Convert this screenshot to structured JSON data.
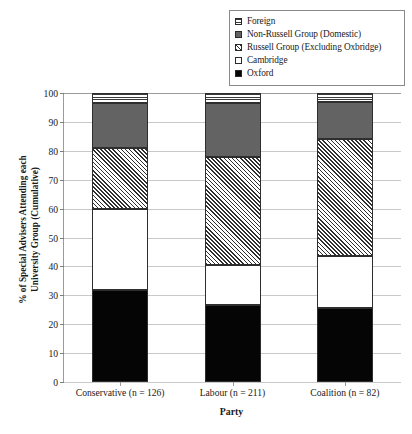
{
  "chart_data": {
    "type": "bar",
    "subtype": "stacked-100-percent",
    "title": "",
    "xlabel": "Party",
    "ylabel": "% of Special Advisers Attending each University Group (Cumulative)",
    "ylabel_lines": [
      "% of Special Advisers Attending each",
      "University Group (Cumulative)"
    ],
    "categories": [
      "Conservative (n = 126)",
      "Labour (n = 211)",
      "Coalition (n = 82)"
    ],
    "ylim": [
      0,
      100
    ],
    "ytick_step": 10,
    "yticks": [
      0,
      10,
      20,
      30,
      40,
      50,
      60,
      70,
      80,
      90,
      100
    ],
    "ytick_labels": [
      "0",
      "10",
      "20",
      "30",
      "40",
      "50",
      "60",
      "70",
      "80",
      "90",
      "100"
    ],
    "grid": true,
    "legend_position": "top-right",
    "series": [
      {
        "name": "Oxford",
        "pattern": "solid-black",
        "color": "#050505",
        "values": [
          31.8,
          26.5,
          25.5
        ],
        "cumulative_top": [
          31.8,
          26.5,
          25.5
        ]
      },
      {
        "name": "Cambridge",
        "pattern": "solid-white",
        "color": "#ffffff",
        "values": [
          28.2,
          14.0,
          18.0
        ],
        "cumulative_top": [
          60.0,
          40.5,
          43.5
        ]
      },
      {
        "name": "Russell Group (Excluding Oxbridge)",
        "pattern": "diagonal-hatch",
        "color": "#2f2f2f",
        "values": [
          21.0,
          37.5,
          40.5
        ],
        "cumulative_top": [
          81.0,
          78.0,
          84.0
        ]
      },
      {
        "name": "Non-Russell Group (Domestic)",
        "pattern": "solid-gray",
        "color": "#636363",
        "values": [
          15.5,
          18.5,
          13.0
        ],
        "cumulative_top": [
          96.5,
          96.5,
          97.0
        ]
      },
      {
        "name": "Foreign",
        "pattern": "horizontal-lines",
        "color": "#3a3a3a",
        "values": [
          3.5,
          3.5,
          3.0
        ],
        "cumulative_top": [
          100.0,
          100.0,
          100.0
        ]
      }
    ]
  },
  "legend": {
    "items": [
      {
        "label": "Foreign",
        "swatch": "horizontal-lines-swatch"
      },
      {
        "label": "Non-Russell Group (Domestic)",
        "swatch": "gray-fill-swatch"
      },
      {
        "label": "Russell Group (Excluding Oxbridge)",
        "swatch": "diagonal-hatch-swatch"
      },
      {
        "label": "Cambridge",
        "swatch": "white-fill-swatch"
      },
      {
        "label": "Oxford",
        "swatch": "black-fill-swatch"
      }
    ]
  }
}
